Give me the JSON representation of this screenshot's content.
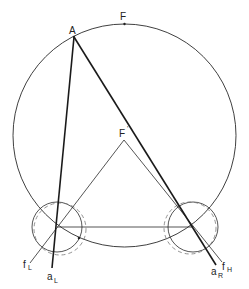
{
  "diagram": {
    "labels": {
      "F": "F",
      "A": "A",
      "F_prime": "F",
      "F_prime_mark": "'",
      "a_L": "a",
      "a_L_sub": "L",
      "f_L": "f",
      "f_L_sub": "L",
      "a_R": "a",
      "a_R_sub": "R",
      "f_H": "f",
      "f_H_sub": "H"
    },
    "colors": {
      "stroke": "#2a2a2a",
      "dashed": "#777777",
      "background": "#ffffff"
    }
  }
}
